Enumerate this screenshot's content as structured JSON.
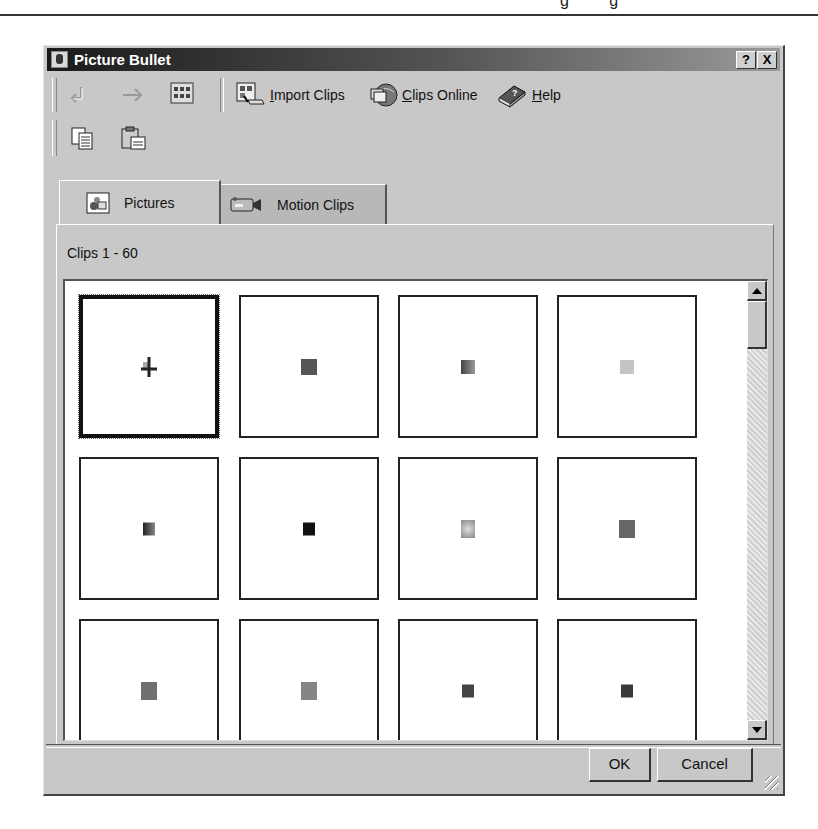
{
  "page": {
    "top_text": "g g"
  },
  "dialog": {
    "title": "Picture Bullet",
    "help_button": "?",
    "close_button": "X"
  },
  "toolbar": {
    "back_label": "Back",
    "forward_label": "Forward",
    "all_categories_label": "All Categories",
    "import_clips": {
      "prefix": "I",
      "rest": "mport Clips"
    },
    "clips_online": {
      "prefix": "C",
      "rest": "lips Online"
    },
    "help": {
      "prefix": "H",
      "rest": "elp"
    },
    "copy_label": "Copy",
    "paste_label": "Paste"
  },
  "tabs": [
    {
      "label": "Pictures",
      "active": true
    },
    {
      "label": "Motion Clips",
      "active": false
    }
  ],
  "clips_count": "Clips 1 - 60",
  "grid": {
    "thumbnails": [
      {
        "row": 1,
        "col": 1,
        "color": "#444444",
        "selected": true
      },
      {
        "row": 1,
        "col": 2,
        "color": "#555555"
      },
      {
        "row": 1,
        "col": 3,
        "color": "#6a6a6a"
      },
      {
        "row": 1,
        "col": 4,
        "color": "#c4c4c4"
      },
      {
        "row": 2,
        "col": 1,
        "color": "#4a4a4a"
      },
      {
        "row": 2,
        "col": 2,
        "color": "#111111"
      },
      {
        "row": 2,
        "col": 3,
        "color": "#9a9a9a"
      },
      {
        "row": 2,
        "col": 4,
        "color": "#666666"
      },
      {
        "row": 3,
        "col": 1,
        "color": "#707070"
      },
      {
        "row": 3,
        "col": 2,
        "color": "#858585"
      },
      {
        "row": 3,
        "col": 3,
        "color": "#444444"
      },
      {
        "row": 3,
        "col": 4,
        "color": "#3a3a3a"
      }
    ]
  },
  "buttons": {
    "ok": "OK",
    "cancel": "Cancel"
  }
}
